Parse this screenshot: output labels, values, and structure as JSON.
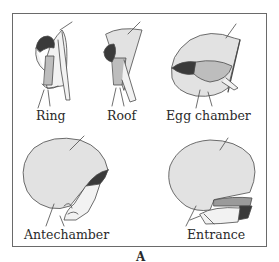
{
  "figure": {
    "panel_label": "A",
    "stages": [
      {
        "id": "ring",
        "label": "Ring"
      },
      {
        "id": "roof",
        "label": "Roof"
      },
      {
        "id": "egg-chamber",
        "label": "Egg chamber"
      },
      {
        "id": "antechamber",
        "label": "Antechamber"
      },
      {
        "id": "entrance",
        "label": "Entrance"
      }
    ]
  },
  "colors": {
    "nest_fill": "#e2e2e2",
    "bird_head": "#3a3a3a",
    "bird_body": "#bdbdbd",
    "outline": "#4a4a4a",
    "frame": "#6a6a6a"
  }
}
